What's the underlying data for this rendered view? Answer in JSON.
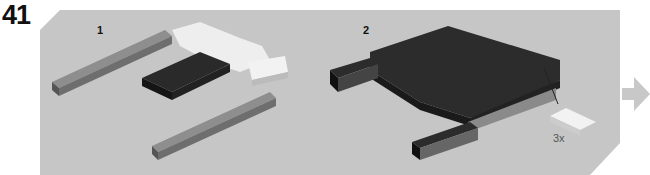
{
  "step": {
    "number": "41"
  },
  "substeps": [
    {
      "label": "1"
    },
    {
      "label": "2"
    }
  ],
  "callout": {
    "quantity": "3x"
  },
  "colors": {
    "panel": "#c6c6c6",
    "arrow": "#c8c8c8",
    "dark_brick": "#2a2a2a",
    "gray_brick": "#8e8e8e",
    "white_brick": "#eeeeee"
  },
  "icons": {
    "next": "arrow-right-icon"
  }
}
